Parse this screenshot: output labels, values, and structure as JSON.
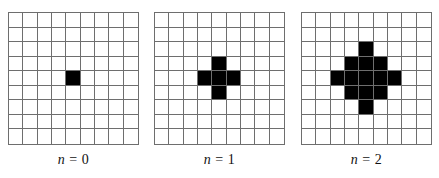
{
  "figure": {
    "grid_rows": 9,
    "grid_cols": 9,
    "fill_color": "#000000",
    "line_color": "#6e6e6e",
    "panels": [
      {
        "label_var": "n",
        "label_eq": " = ",
        "label_val": "0",
        "filled_cells": [
          [
            4,
            4
          ]
        ]
      },
      {
        "label_var": "n",
        "label_eq": " = ",
        "label_val": "1",
        "filled_cells": [
          [
            3,
            4
          ],
          [
            4,
            3
          ],
          [
            4,
            4
          ],
          [
            4,
            5
          ],
          [
            5,
            4
          ]
        ]
      },
      {
        "label_var": "n",
        "label_eq": " = ",
        "label_val": "2",
        "filled_cells": [
          [
            2,
            4
          ],
          [
            3,
            3
          ],
          [
            3,
            4
          ],
          [
            3,
            5
          ],
          [
            4,
            2
          ],
          [
            4,
            3
          ],
          [
            4,
            4
          ],
          [
            4,
            5
          ],
          [
            4,
            6
          ],
          [
            5,
            3
          ],
          [
            5,
            4
          ],
          [
            5,
            5
          ],
          [
            6,
            4
          ]
        ]
      }
    ]
  }
}
